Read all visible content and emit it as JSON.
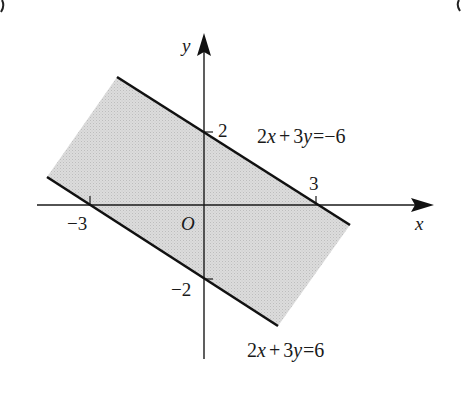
{
  "figure": {
    "axes": {
      "x_label": "x",
      "y_label": "y",
      "origin_label": "O"
    },
    "ticks": {
      "x_pos": "3",
      "x_neg": "−3",
      "y_pos": "2",
      "y_neg": "−2"
    },
    "lines": [
      {
        "name": "upper-boundary",
        "equation": "2x+3y=−6",
        "eq_parts": {
          "a": "2",
          "x": "x",
          "plus": "+",
          "b": "3",
          "y": "y",
          "eq": "=",
          "rhs": "−6"
        }
      },
      {
        "name": "lower-boundary",
        "equation": "2x+3y=6",
        "eq_parts": {
          "a": "2",
          "x": "x",
          "plus": "+",
          "b": "3",
          "y": "y",
          "eq": "=",
          "rhs": "6"
        }
      }
    ],
    "region": {
      "description": "shaded band between the two parallel lines",
      "fill_color": "#d6d6d6"
    },
    "colors": {
      "line": "#111111",
      "axis": "#1a1a1a",
      "background": "#ffffff"
    }
  }
}
